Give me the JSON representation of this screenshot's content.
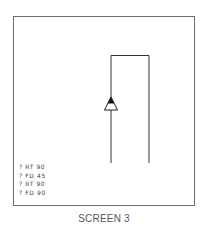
{
  "screen": {
    "border_color": "#6e6e6e",
    "line_color": "#333333"
  },
  "command_log": [
    {
      "prompt": "?",
      "command": "RT 90"
    },
    {
      "prompt": "?",
      "command": "FD 45"
    },
    {
      "prompt": "?",
      "command": "RT 90"
    },
    {
      "prompt": "?",
      "command": "FD 90"
    }
  ],
  "turtle": {
    "icon": "triangle-turtle",
    "heading": "up"
  },
  "caption": "SCREEN 3"
}
